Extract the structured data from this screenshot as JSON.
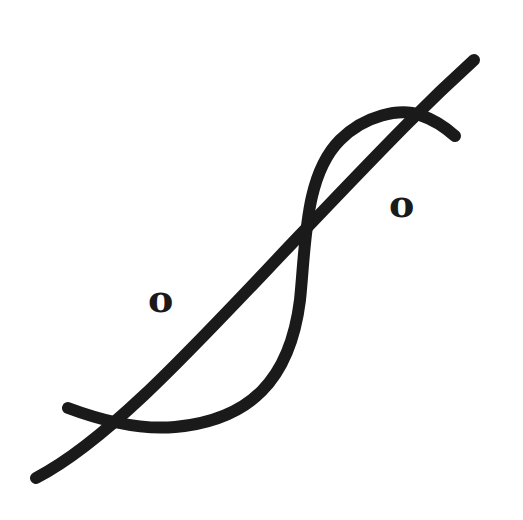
{
  "symbol": {
    "description": "Line drawing with a diagonal stroke crossed by an S-shaped curve and two small circle glyphs",
    "stroke_color": "#1a1a1a",
    "background": "#ffffff",
    "glyphs": {
      "left": "o",
      "right": "o"
    }
  }
}
